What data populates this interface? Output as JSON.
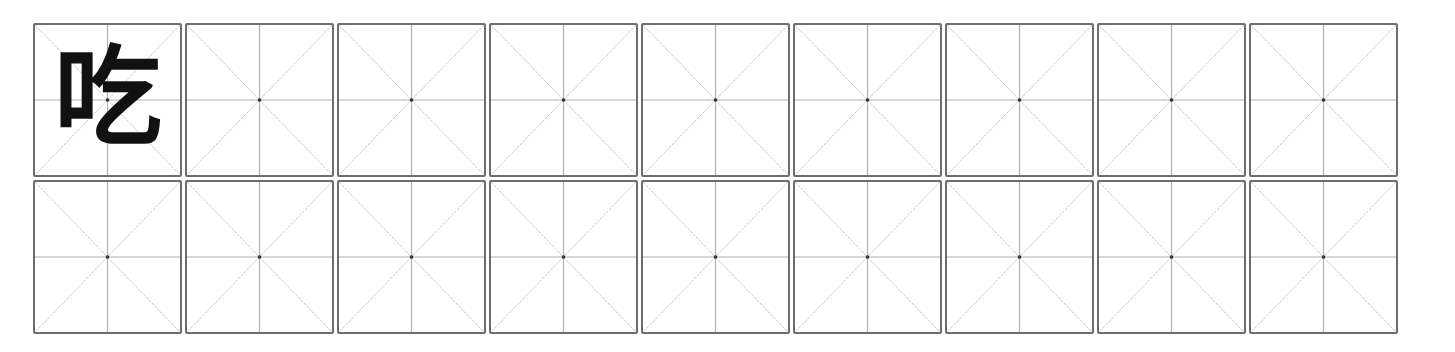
{
  "worksheet": {
    "type": "mi-zi-ge practice grid",
    "rows": 2,
    "columns": 9,
    "colors": {
      "border": "#6e6e6e",
      "guide_line": "#b8b8b8",
      "center_dot": "#333333",
      "character": "#111111"
    },
    "cells": [
      {
        "row": 1,
        "col": 1,
        "character": "吃"
      },
      {
        "row": 1,
        "col": 2,
        "character": ""
      },
      {
        "row": 1,
        "col": 3,
        "character": ""
      },
      {
        "row": 1,
        "col": 4,
        "character": ""
      },
      {
        "row": 1,
        "col": 5,
        "character": ""
      },
      {
        "row": 1,
        "col": 6,
        "character": ""
      },
      {
        "row": 1,
        "col": 7,
        "character": ""
      },
      {
        "row": 1,
        "col": 8,
        "character": ""
      },
      {
        "row": 1,
        "col": 9,
        "character": ""
      },
      {
        "row": 2,
        "col": 1,
        "character": ""
      },
      {
        "row": 2,
        "col": 2,
        "character": ""
      },
      {
        "row": 2,
        "col": 3,
        "character": ""
      },
      {
        "row": 2,
        "col": 4,
        "character": ""
      },
      {
        "row": 2,
        "col": 5,
        "character": ""
      },
      {
        "row": 2,
        "col": 6,
        "character": ""
      },
      {
        "row": 2,
        "col": 7,
        "character": ""
      },
      {
        "row": 2,
        "col": 8,
        "character": ""
      },
      {
        "row": 2,
        "col": 9,
        "character": ""
      }
    ]
  }
}
